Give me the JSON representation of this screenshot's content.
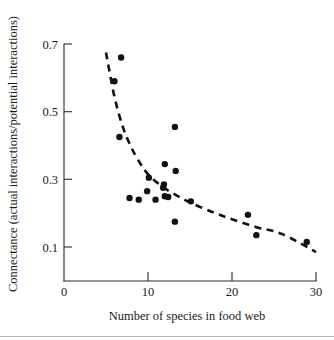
{
  "chart_data": {
    "type": "scatter",
    "title": "",
    "xlabel": "Number of species in food web",
    "ylabel": "Connectance (actual interactions/potential interactions)",
    "xlim": [
      0,
      30
    ],
    "ylim": [
      0,
      0.78
    ],
    "xticks": [
      0,
      10,
      20,
      30
    ],
    "xtick_labels": [
      "0",
      "10",
      "20",
      "30"
    ],
    "yticks": [
      0.1,
      0.3,
      0.5,
      0.7
    ],
    "ytick_labels": [
      "0.1",
      "0.3",
      "0.5",
      "0.7"
    ],
    "grid": false,
    "legend": "none",
    "points": [
      {
        "x": 6.8,
        "y": 0.66
      },
      {
        "x": 6.0,
        "y": 0.59
      },
      {
        "x": 6.6,
        "y": 0.425
      },
      {
        "x": 13.2,
        "y": 0.455
      },
      {
        "x": 12.0,
        "y": 0.345
      },
      {
        "x": 13.3,
        "y": 0.325
      },
      {
        "x": 10.1,
        "y": 0.305
      },
      {
        "x": 11.9,
        "y": 0.285
      },
      {
        "x": 11.8,
        "y": 0.275
      },
      {
        "x": 9.9,
        "y": 0.265
      },
      {
        "x": 7.8,
        "y": 0.245
      },
      {
        "x": 8.9,
        "y": 0.24
      },
      {
        "x": 10.9,
        "y": 0.24
      },
      {
        "x": 12.0,
        "y": 0.25
      },
      {
        "x": 12.4,
        "y": 0.248
      },
      {
        "x": 15.1,
        "y": 0.235
      },
      {
        "x": 13.2,
        "y": 0.175
      },
      {
        "x": 21.9,
        "y": 0.195
      },
      {
        "x": 22.9,
        "y": 0.135
      },
      {
        "x": 28.9,
        "y": 0.115
      }
    ],
    "fit_curve": {
      "style": "dashed",
      "description": "decreasing power-law trend line",
      "path_points": [
        {
          "x": 5.0,
          "y": 0.675
        },
        {
          "x": 6.0,
          "y": 0.545
        },
        {
          "x": 7.0,
          "y": 0.455
        },
        {
          "x": 8.0,
          "y": 0.395
        },
        {
          "x": 9.0,
          "y": 0.35
        },
        {
          "x": 10.0,
          "y": 0.315
        },
        {
          "x": 11.5,
          "y": 0.282
        },
        {
          "x": 13.0,
          "y": 0.258
        },
        {
          "x": 15.0,
          "y": 0.232
        },
        {
          "x": 17.5,
          "y": 0.205
        },
        {
          "x": 20.0,
          "y": 0.182
        },
        {
          "x": 23.0,
          "y": 0.158
        },
        {
          "x": 26.0,
          "y": 0.138
        },
        {
          "x": 30.0,
          "y": 0.085
        }
      ]
    }
  }
}
